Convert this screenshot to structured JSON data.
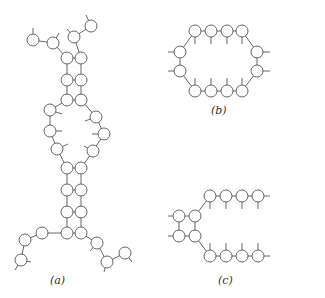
{
  "figure": {
    "panels": [
      {
        "id": "a",
        "label": "(a)",
        "label_pos": [
          50,
          274
        ]
      },
      {
        "id": "b",
        "label": "(b)",
        "label_pos": [
          211,
          104
        ]
      },
      {
        "id": "c",
        "label": "(c)",
        "label_pos": [
          218,
          274
        ]
      }
    ],
    "style": {
      "stroke": "#555555",
      "node_fill": "#ffffff",
      "node_radius": 6
    }
  }
}
